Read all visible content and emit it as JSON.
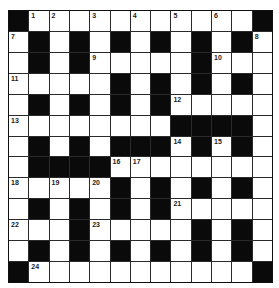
{
  "puzzle": {
    "type": "crossword",
    "rows": 13,
    "cols": 13,
    "colors": {
      "block": "#0a0a0a",
      "cell": "#ffffff",
      "grid_line": "#2a2a2a"
    },
    "grid": [
      [
        "#",
        "1",
        "2",
        ".",
        "3",
        ".",
        "4",
        ".",
        "5",
        ".",
        "6",
        ".",
        "#"
      ],
      [
        "7",
        "#",
        ".",
        "#",
        ".",
        "#",
        ".",
        "#",
        ".",
        "#",
        ".",
        "#",
        "8"
      ],
      [
        ".",
        "#",
        ".",
        "#",
        "9",
        ".",
        ".",
        ".",
        ".",
        "#",
        "10",
        ".",
        "."
      ],
      [
        "11",
        ".",
        ".",
        ".",
        ".",
        "#",
        ".",
        "#",
        ".",
        "#",
        ".",
        "#",
        "."
      ],
      [
        ".",
        "#",
        ".",
        "#",
        ".",
        "#",
        ".",
        "#",
        "12",
        ".",
        ".",
        ".",
        "."
      ],
      [
        "13",
        ".",
        ".",
        ".",
        ".",
        ".",
        ".",
        ".",
        "#",
        "#",
        "#",
        "#",
        "."
      ],
      [
        ".",
        "#",
        ".",
        "#",
        ".",
        "#",
        "#",
        "#",
        "14",
        "#",
        "15",
        "#",
        "."
      ],
      [
        ".",
        "#",
        "#",
        "#",
        "#",
        "16",
        "17",
        ".",
        ".",
        ".",
        ".",
        ".",
        "."
      ],
      [
        "18",
        ".",
        "19",
        ".",
        "20",
        "#",
        ".",
        "#",
        ".",
        "#",
        ".",
        "#",
        "."
      ],
      [
        ".",
        "#",
        ".",
        "#",
        ".",
        "#",
        ".",
        "#",
        "21",
        ".",
        ".",
        ".",
        "."
      ],
      [
        "22",
        ".",
        ".",
        "#",
        "23",
        ".",
        ".",
        ".",
        ".",
        "#",
        ".",
        "#",
        "."
      ],
      [
        ".",
        "#",
        ".",
        "#",
        ".",
        "#",
        ".",
        "#",
        ".",
        "#",
        ".",
        "#",
        "."
      ],
      [
        "#",
        "24",
        ".",
        ".",
        ".",
        ".",
        ".",
        ".",
        ".",
        ".",
        ".",
        ".",
        "#"
      ]
    ],
    "clue_numbers": [
      "1",
      "2",
      "3",
      "4",
      "5",
      "6",
      "7",
      "8",
      "9",
      "10",
      "11",
      "12",
      "13",
      "14",
      "15",
      "16",
      "17",
      "18",
      "19",
      "20",
      "21",
      "22",
      "23",
      "24"
    ]
  }
}
